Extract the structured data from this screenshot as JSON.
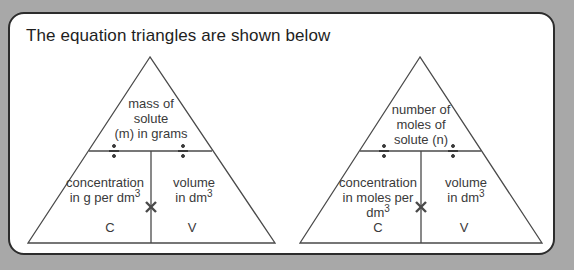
{
  "title": "The equation triangles are shown below",
  "triangles": [
    {
      "top": [
        "mass of",
        "solute",
        "(m) in grams"
      ],
      "left": [
        "concentration",
        "in g per dm"
      ],
      "left_sup": "3",
      "right": [
        "volume",
        "in dm"
      ],
      "right_sup": "3",
      "left_symbol": "C",
      "right_symbol": "V",
      "divide_symbol": "÷",
      "multiply_symbol": "×"
    },
    {
      "top": [
        "number of",
        "moles of",
        "solute (n)"
      ],
      "left": [
        "concentration",
        "in moles per",
        "dm"
      ],
      "left_sup": "3",
      "right": [
        "volume",
        "in dm"
      ],
      "right_sup": "3",
      "left_symbol": "C",
      "right_symbol": "V",
      "divide_symbol": "÷",
      "multiply_symbol": "×"
    }
  ]
}
